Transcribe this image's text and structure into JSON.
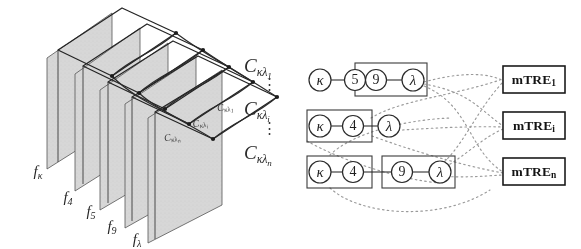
{
  "figure": {
    "background_color": "#ffffff",
    "ink_color": "#1f1f1f",
    "sheet_fill_color": "#d6d6d6",
    "dotted_color": "#8a8a8a"
  },
  "left_panel": {
    "name": "stacked-image-planes",
    "plane_labels": [
      {
        "id": "f-kappa",
        "text": "f",
        "sub": "κ"
      },
      {
        "id": "f-4",
        "text": "f",
        "sub": "4"
      },
      {
        "id": "f-5",
        "text": "f",
        "sub": "5"
      },
      {
        "id": "f-9",
        "text": "f",
        "sub": "9"
      },
      {
        "id": "f-lambda",
        "text": "f",
        "sub": "λ"
      }
    ],
    "sheet_labels": [
      {
        "id": "c-kappa-lambda-1",
        "text": "C",
        "sub": "κλ",
        "subsub": "1"
      },
      {
        "id": "c-kappa-lambda-i",
        "text": "C",
        "sub": "κλ",
        "subsub": "i"
      },
      {
        "id": "c-kappa-lambda-n",
        "text": "C",
        "sub": "κλ",
        "subsub": "n"
      }
    ]
  },
  "c_labels": [
    {
      "id": "c-label-1",
      "text": "C",
      "sub": "κλ",
      "subsub": "1"
    },
    {
      "id": "c-label-i",
      "text": "C",
      "sub": "κλ",
      "subsub": "i"
    },
    {
      "id": "c-label-n",
      "text": "C",
      "sub": "κλ",
      "subsub": "n"
    }
  ],
  "ellipsis": {
    "glyph": "⋮"
  },
  "graph": {
    "rows": [
      {
        "id": "row-1",
        "nodes": [
          {
            "id": "node-kappa",
            "label": "κ",
            "greek": true
          },
          {
            "id": "node-5",
            "label": "5",
            "greek": false
          },
          {
            "id": "node-9",
            "label": "9",
            "greek": false
          },
          {
            "id": "node-lambda",
            "label": "λ",
            "greek": true
          }
        ],
        "group_box": {
          "from": 2,
          "to": 3
        }
      },
      {
        "id": "row-i",
        "nodes": [
          {
            "id": "node-kappa",
            "label": "κ",
            "greek": true
          },
          {
            "id": "node-4",
            "label": "4",
            "greek": false
          },
          {
            "id": "node-lambda",
            "label": "λ",
            "greek": true
          }
        ],
        "group_box": {
          "from": 0,
          "to": 1
        }
      },
      {
        "id": "row-n",
        "nodes": [
          {
            "id": "node-kappa",
            "label": "κ",
            "greek": true
          },
          {
            "id": "node-4",
            "label": "4",
            "greek": false
          },
          {
            "id": "node-9",
            "label": "9",
            "greek": false
          },
          {
            "id": "node-lambda",
            "label": "λ",
            "greek": true
          }
        ],
        "group_boxes": [
          {
            "from": 0,
            "to": 1
          },
          {
            "from": 2,
            "to": 3
          }
        ]
      }
    ]
  },
  "mtre_boxes": [
    {
      "id": "mtre-1",
      "text": "mTRE",
      "sub": "1"
    },
    {
      "id": "mtre-i",
      "text": "mTRE",
      "sub": "i"
    },
    {
      "id": "mtre-n",
      "text": "mTRE",
      "sub": "n"
    }
  ]
}
